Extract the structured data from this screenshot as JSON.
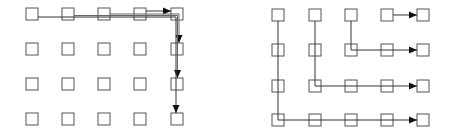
{
  "figure": {
    "node_color": "#555555",
    "edge_color": "#333333",
    "background": "#ffffff"
  },
  "left_grid": {
    "name": "gather-to-corner-then-down",
    "columns": 5,
    "rows": 4,
    "col_x": [
      32,
      68,
      104,
      140,
      177
    ],
    "row_y": [
      14,
      49,
      84,
      119
    ],
    "node_size": 12,
    "paths": [
      {
        "from": [
          3,
          0
        ],
        "to": [
          4,
          0
        ],
        "route": "right"
      },
      {
        "from": [
          2,
          0
        ],
        "to": [
          4,
          1
        ],
        "route": "right-then-down"
      },
      {
        "from": [
          1,
          0
        ],
        "to": [
          4,
          2
        ],
        "route": "right-then-down"
      },
      {
        "from": [
          0,
          0
        ],
        "to": [
          4,
          3
        ],
        "route": "right-then-down"
      }
    ]
  },
  "right_grid": {
    "name": "down-then-right",
    "columns": 5,
    "rows": 4,
    "col_x": [
      278,
      315,
      351,
      387,
      423
    ],
    "row_y": [
      15,
      50,
      86,
      120
    ],
    "node_size": 12,
    "paths": [
      {
        "from": [
          3,
          0
        ],
        "to": [
          4,
          0
        ],
        "route": "right"
      },
      {
        "from": [
          2,
          0
        ],
        "to": [
          4,
          1
        ],
        "route": "down-then-right"
      },
      {
        "from": [
          1,
          0
        ],
        "to": [
          4,
          2
        ],
        "route": "down-then-right"
      },
      {
        "from": [
          0,
          0
        ],
        "to": [
          4,
          3
        ],
        "route": "down-then-right"
      }
    ]
  }
}
